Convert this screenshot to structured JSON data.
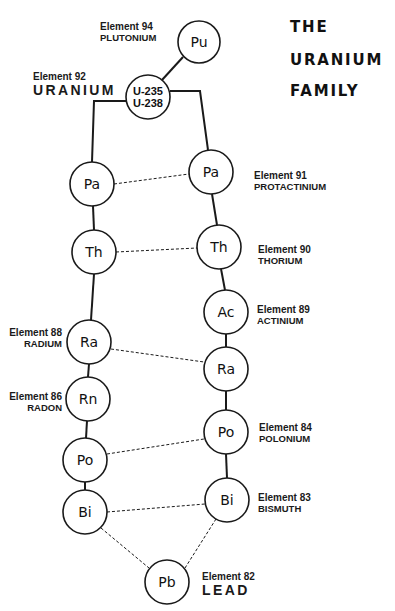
{
  "title": {
    "lines": [
      "THE",
      "URANIUM",
      "FAMILY"
    ]
  },
  "nodes": [
    {
      "id": "pu",
      "symbol": "Pu",
      "cx": 199,
      "cy": 42,
      "r": 21
    },
    {
      "id": "u",
      "symbol": "U-235",
      "symbol2": "U-238",
      "cx": 148,
      "cy": 97,
      "r": 22
    },
    {
      "id": "pa_l",
      "symbol": "Pa",
      "cx": 92,
      "cy": 184,
      "r": 22
    },
    {
      "id": "pa_r",
      "symbol": "Pa",
      "cx": 211,
      "cy": 172,
      "r": 22
    },
    {
      "id": "th_l",
      "symbol": "Th",
      "cx": 94,
      "cy": 252,
      "r": 22
    },
    {
      "id": "th_r",
      "symbol": "Th",
      "cx": 219,
      "cy": 247,
      "r": 22
    },
    {
      "id": "ac",
      "symbol": "Ac",
      "cx": 226,
      "cy": 312,
      "r": 22
    },
    {
      "id": "ra_l",
      "symbol": "Ra",
      "cx": 89,
      "cy": 342,
      "r": 22
    },
    {
      "id": "ra_r",
      "symbol": "Ra",
      "cx": 226,
      "cy": 369,
      "r": 22
    },
    {
      "id": "rn",
      "symbol": "Rn",
      "cx": 88,
      "cy": 399,
      "r": 22
    },
    {
      "id": "po_r",
      "symbol": "Po",
      "cx": 226,
      "cy": 432,
      "r": 22
    },
    {
      "id": "po_l",
      "symbol": "Po",
      "cx": 85,
      "cy": 460,
      "r": 22
    },
    {
      "id": "bi_l",
      "symbol": "Bi",
      "cx": 85,
      "cy": 512,
      "r": 22
    },
    {
      "id": "bi_r",
      "symbol": "Bi",
      "cx": 227,
      "cy": 500,
      "r": 22
    },
    {
      "id": "pb",
      "symbol": "Pb",
      "cx": 167,
      "cy": 582,
      "r": 22
    }
  ],
  "solid_edges": [
    "M183,57 L162,80",
    "M126,101 L94,101 L92,162",
    "M170,91 L200,91 L208,150",
    "M93,206 L94,230",
    "M212,194 L217,225",
    "M94,274 L91,320",
    "M221,269 L225,290",
    "M226,334 L226,347",
    "M89,364 L88,377",
    "M226,391 L226,410",
    "M87,421 L86,438",
    "M85,482 L85,490",
    "M226,454 L227,478"
  ],
  "dashed_edges": [
    "M114,184 L189,174",
    "M116,252 L197,248",
    "M111,349 L204,362",
    "M107,454 L204,439",
    "M107,512 L205,504",
    "M101,528 L149,568",
    "M185,568 L216,519"
  ],
  "labels": [
    {
      "id": "pu",
      "number": "Element 94",
      "name": "PLUTONIUM",
      "x": 100,
      "y": 21,
      "align": "left",
      "big": false
    },
    {
      "id": "u",
      "number": "Element 92",
      "name": "URANIUM",
      "x": 33,
      "y": 71,
      "align": "left",
      "big": true
    },
    {
      "id": "pa",
      "number": "Element 91",
      "name": "PROTACTINIUM",
      "x": 254,
      "y": 170,
      "align": "left",
      "big": false
    },
    {
      "id": "th",
      "number": "Element 90",
      "name": "THORIUM",
      "x": 258,
      "y": 244,
      "align": "left",
      "big": false
    },
    {
      "id": "ac",
      "number": "Element 89",
      "name": "ACTINIUM",
      "x": 257,
      "y": 304,
      "align": "left",
      "big": false
    },
    {
      "id": "ra",
      "number": "Element 88",
      "name": "RADIUM",
      "x": 62,
      "y": 327,
      "align": "right",
      "big": false
    },
    {
      "id": "rn",
      "number": "Element 86",
      "name": "RADON",
      "x": 62,
      "y": 391,
      "align": "right",
      "big": false
    },
    {
      "id": "po",
      "number": "Element 84",
      "name": "POLONIUM",
      "x": 259,
      "y": 422,
      "align": "left",
      "big": false
    },
    {
      "id": "bi",
      "number": "Element 83",
      "name": "BISMUTH",
      "x": 258,
      "y": 492,
      "align": "left",
      "big": false
    },
    {
      "id": "pb",
      "number": "Element 82",
      "name": "LEAD",
      "x": 202,
      "y": 571,
      "align": "left",
      "big": true
    }
  ],
  "colors": {
    "ink": "#1a1a1a",
    "background": "#ffffff"
  }
}
